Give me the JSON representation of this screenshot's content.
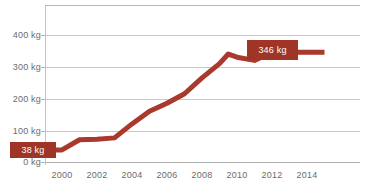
{
  "chart_data": {
    "type": "line",
    "title": "",
    "xlabel": "",
    "ylabel": "",
    "unit": "kg",
    "grid": "horizontal",
    "legend": "none",
    "line_color": "#A8392C",
    "background_color": "#FFFFFF",
    "xlim": [
      1998.5,
      2015.5
    ],
    "ylim": [
      0,
      470
    ],
    "y_ticks": [
      0,
      100,
      200,
      300,
      400
    ],
    "y_tick_labels": [
      "0 kg",
      "100 kg",
      "200 kg",
      "300 kg",
      "400 kg"
    ],
    "x_ticks": [
      2000,
      2002,
      2004,
      2006,
      2008,
      2010,
      2012,
      2014
    ],
    "x_tick_labels": [
      "2000",
      "2002",
      "2004",
      "2006",
      "2008",
      "2010",
      "2012",
      "2014"
    ],
    "x": [
      1999,
      2000,
      2001,
      2002,
      2003,
      2004,
      2005,
      2006,
      2007,
      2008,
      2009,
      2009.5,
      2010,
      2011,
      2012,
      2013,
      2014,
      2015
    ],
    "values": [
      38,
      38,
      70,
      72,
      76,
      120,
      160,
      185,
      215,
      265,
      310,
      340,
      330,
      320,
      346,
      346,
      346,
      346
    ],
    "annotations": [
      {
        "label": "38 kg",
        "value": 38,
        "x": 1999,
        "position": "left"
      },
      {
        "label": "346 kg",
        "value": 346,
        "x": 2012,
        "position": "right"
      }
    ]
  },
  "labels": {
    "y_axis": [
      "400 kg",
      "300 kg",
      "200 kg",
      "100 kg",
      "0 kg"
    ],
    "x_axis": [
      "2000",
      "2002",
      "2004",
      "2006",
      "2008",
      "2010",
      "2012",
      "2014"
    ],
    "badge_start": "38 kg",
    "badge_end": "346 kg",
    "clipped_title": ""
  }
}
